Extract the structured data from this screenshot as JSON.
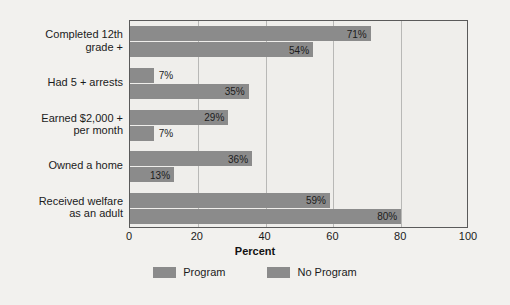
{
  "chart_data": {
    "type": "bar",
    "orientation": "horizontal",
    "title": "",
    "xlabel": "Percent",
    "ylabel": "",
    "xlim": [
      0,
      100
    ],
    "xticks": [
      0,
      20,
      40,
      60,
      80,
      100
    ],
    "xtick_labels": [
      "0",
      "20",
      "40",
      "60",
      "80",
      "100"
    ],
    "grid": true,
    "grid_axis": "x",
    "legend_position": "bottom",
    "categories": [
      "Completed 12th\ngrade +",
      "Had 5 + arrests",
      "Earned $2,000 +\nper month",
      "Owned a home",
      "Received welfare\nas an adult"
    ],
    "series": [
      {
        "name": "Program",
        "color": "#8b8b8b",
        "values": [
          71,
          7,
          29,
          36,
          59
        ],
        "value_labels": [
          "71%",
          "7%",
          "29%",
          "36%",
          "59%"
        ]
      },
      {
        "name": "No Program",
        "color": "#8b8b8b",
        "values": [
          54,
          35,
          7,
          13,
          80
        ],
        "value_labels": [
          "54%",
          "35%",
          "7%",
          "13%",
          "80%"
        ]
      }
    ]
  },
  "axis": {
    "x_title": "Percent",
    "tick_labels": [
      "0",
      "20",
      "40",
      "60",
      "80",
      "100"
    ]
  },
  "legend": {
    "items": [
      {
        "label": "Program",
        "color": "#8b8b8b"
      },
      {
        "label": "No Program",
        "color": "#8b8b8b"
      }
    ]
  },
  "categories": [
    {
      "line1": "Completed 12th",
      "line2": "grade +"
    },
    {
      "line1": "Had 5 + arrests",
      "line2": ""
    },
    {
      "line1": "Earned $2,000 +",
      "line2": "per month"
    },
    {
      "line1": "Owned a home",
      "line2": ""
    },
    {
      "line1": "Received welfare",
      "line2": "as an adult"
    }
  ]
}
